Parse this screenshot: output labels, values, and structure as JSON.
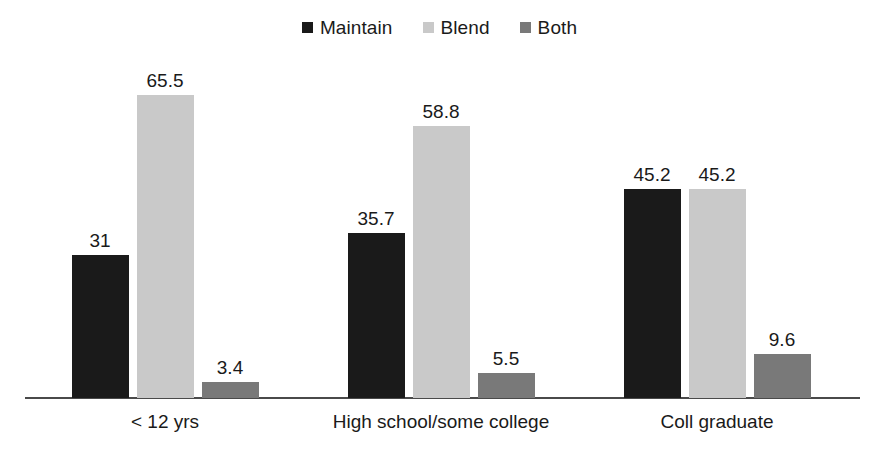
{
  "chart_data": {
    "type": "bar",
    "title": "",
    "subtitle": "",
    "xlabel": "",
    "ylabel": "",
    "ylim": [
      0,
      65.5
    ],
    "grid": false,
    "legend_position": "top-center",
    "categories": [
      "< 12 yrs",
      "High school/some college",
      "Coll graduate"
    ],
    "series": [
      {
        "name": "Maintain",
        "color": "#1a1a1a",
        "values": [
          31,
          35.7,
          45.2
        ],
        "value_labels": [
          "31",
          "35.7",
          "45.2"
        ]
      },
      {
        "name": "Blend",
        "color": "#c9c9c9",
        "values": [
          65.5,
          58.8,
          45.2
        ],
        "value_labels": [
          "65.5",
          "58.8",
          "45.2"
        ]
      },
      {
        "name": "Both",
        "color": "#797979",
        "values": [
          3.4,
          5.5,
          9.6
        ],
        "value_labels": [
          "3.4",
          "5.5",
          "9.6"
        ]
      }
    ]
  },
  "legend": {
    "items": [
      {
        "label": "Maintain",
        "color": "#1a1a1a",
        "swatch_icon": "square-swatch-icon"
      },
      {
        "label": "Blend",
        "color": "#c9c9c9",
        "swatch_icon": "square-swatch-icon"
      },
      {
        "label": "Both",
        "color": "#797979",
        "swatch_icon": "square-swatch-icon"
      }
    ]
  },
  "axis": {
    "baseline_color": "#4a4a4a"
  },
  "colors": {
    "background": "#ffffff",
    "text": "#1a1a1a",
    "maintain": "#1a1a1a",
    "blend": "#c9c9c9",
    "both": "#797979"
  }
}
